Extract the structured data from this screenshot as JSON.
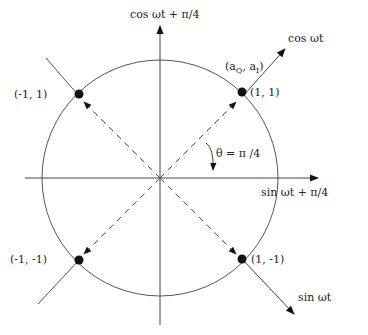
{
  "diagram": {
    "axes": {
      "vertical_label": "cos ωt + π/4",
      "horizontal_label": "sin ωt + π/4",
      "diag_up_label": "cos ωt",
      "diag_down_label": "sin ωt"
    },
    "points": [
      {
        "label": "(1, 1)",
        "x": 1,
        "y": 1
      },
      {
        "label": "(-1, 1)",
        "x": -1,
        "y": 1
      },
      {
        "label": "(-1, -1)",
        "x": -1,
        "y": -1
      },
      {
        "label": "(1, -1)",
        "x": 1,
        "y": -1
      }
    ],
    "vector_label": "(aQ, aI)",
    "vector_label_base": "(a",
    "vector_label_sub1": "Q",
    "vector_label_mid": ", a",
    "vector_label_sub2": "I",
    "vector_label_end": ")",
    "angle_label": "θ = π /4"
  }
}
